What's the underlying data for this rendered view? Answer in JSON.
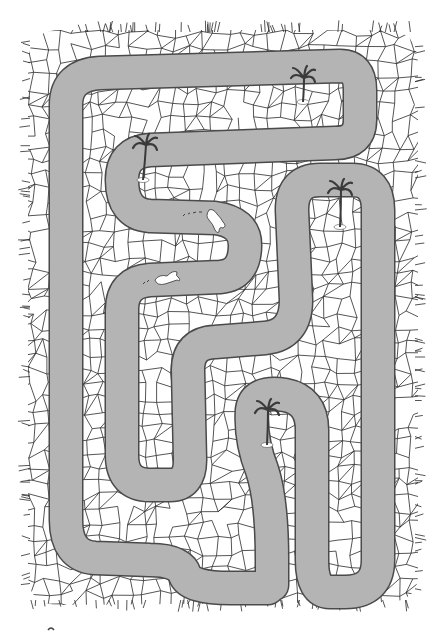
{
  "puzzle": {
    "type": "maze",
    "title": "River maze",
    "description": "Winding river channels through cracked dry ground with palm tree islands and two swimmers",
    "colors": {
      "background": "#ffffff",
      "water": "#b4b4b4",
      "river_edge": "#555555",
      "cracks": "#2a2a2a",
      "palm": "#3a3a3a"
    },
    "palm_trees": [
      {
        "id": "palm-top-right",
        "x": 303,
        "y": 80
      },
      {
        "id": "palm-upper-left",
        "x": 145,
        "y": 145
      },
      {
        "id": "palm-right",
        "x": 340,
        "y": 195
      },
      {
        "id": "palm-bottom-center",
        "x": 267,
        "y": 420
      }
    ],
    "swimmers": [
      {
        "id": "swimmer-1",
        "x": 215,
        "y": 220
      },
      {
        "id": "swimmer-2",
        "x": 167,
        "y": 278
      }
    ]
  }
}
